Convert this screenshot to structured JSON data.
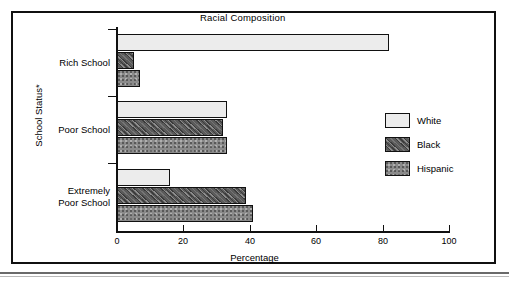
{
  "chart_data": {
    "type": "bar",
    "orientation": "horizontal",
    "title": "Racial Composition",
    "xlabel": "Percentage",
    "ylabel": "School Status*",
    "xlim": [
      0,
      100
    ],
    "xticks": [
      0,
      20,
      40,
      60,
      80,
      100
    ],
    "grid": false,
    "legend_position": "right",
    "categories": [
      "Rich School",
      "Poor School",
      "Extremely\nPoor School"
    ],
    "series": [
      {
        "name": "White",
        "values": [
          82,
          33,
          16
        ]
      },
      {
        "name": "Black",
        "values": [
          5,
          32,
          39
        ]
      },
      {
        "name": "Hispanic",
        "values": [
          7,
          33,
          41
        ]
      }
    ]
  },
  "colors": {
    "white_fill": "#ececec",
    "black_fill": "#5b5b5b",
    "hispanic_fill": "#8a8a8a",
    "axis": "#101010",
    "frame": "#101010"
  },
  "legend": [
    {
      "label": "White"
    },
    {
      "label": "Black"
    },
    {
      "label": "Hispanic"
    }
  ],
  "xticks": [
    {
      "label": "0"
    },
    {
      "label": "20"
    },
    {
      "label": "40"
    },
    {
      "label": "60"
    },
    {
      "label": "80"
    },
    {
      "label": "100"
    }
  ],
  "categories": [
    {
      "label": "Rich School"
    },
    {
      "label": "Poor School"
    },
    {
      "label": "Extremely\nPoor School"
    }
  ]
}
